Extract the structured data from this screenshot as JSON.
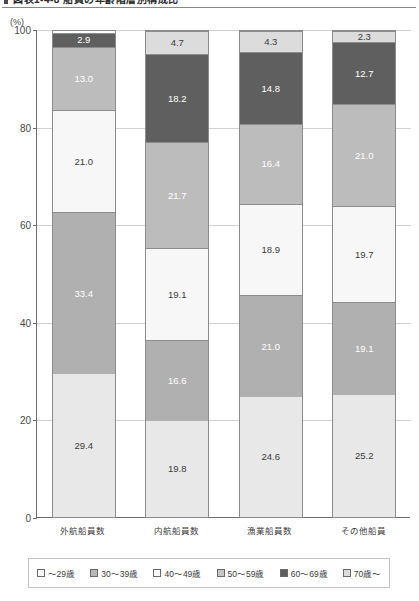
{
  "title": "図表1-4-8 船員の年齢階層別構成比",
  "axis": {
    "unit_label": "(%)",
    "y_ticks": [
      "100",
      "80",
      "60",
      "40",
      "20",
      "0"
    ]
  },
  "chart_data": {
    "type": "bar",
    "title": "図表1-4-8 船員の年齢階層別構成比",
    "subtitle": "",
    "xlabel": "",
    "ylabel": "(%)",
    "ylim": [
      0,
      100
    ],
    "yticks": [
      0,
      20,
      40,
      60,
      80,
      100
    ],
    "grid": true,
    "stacked": true,
    "stack_order": "bottom-to-top",
    "legend_position": "bottom",
    "categories": [
      "外航船員数",
      "内航船員数",
      "漁業船員数",
      "その他船員"
    ],
    "series": [
      {
        "name": "～29歳",
        "color": "#e8e8e8",
        "values": [
          29.4,
          19.8,
          24.6,
          25.2
        ]
      },
      {
        "name": "30～39歳",
        "color": "#b0b0b0",
        "values": [
          33.4,
          16.6,
          21.0,
          19.1
        ]
      },
      {
        "name": "40～49歳",
        "color": "#f7f7f7",
        "values": [
          21.0,
          19.1,
          18.9,
          19.7
        ]
      },
      {
        "name": "50～59歳",
        "color": "#bcbcbc",
        "values": [
          13.0,
          21.7,
          16.4,
          21.0
        ]
      },
      {
        "name": "60～69歳",
        "color": "#5f5f5f",
        "values": [
          2.9,
          18.2,
          14.8,
          12.7
        ]
      },
      {
        "name": "70歳～",
        "color": "#dcdcdc",
        "values": [
          0.0,
          4.7,
          4.3,
          2.3
        ]
      }
    ]
  },
  "bars": [
    {
      "category": "外航船員数",
      "segments": [
        {
          "label": "29.4",
          "value": 29.4,
          "color": "#e8e8e8",
          "text_color": "#3b3b3b"
        },
        {
          "label": "33.4",
          "value": 33.4,
          "color": "#b0b0b0",
          "text_color": "#ffffff"
        },
        {
          "label": "21.0",
          "value": 21.0,
          "color": "#f7f7f7",
          "text_color": "#3b3b3b"
        },
        {
          "label": "13.0",
          "value": 13.0,
          "color": "#bcbcbc",
          "text_color": "#ffffff"
        },
        {
          "label": "2.9",
          "value": 2.9,
          "color": "#5f5f5f",
          "text_color": "#ffffff"
        }
      ]
    },
    {
      "category": "内航船員数",
      "segments": [
        {
          "label": "19.8",
          "value": 19.8,
          "color": "#e8e8e8",
          "text_color": "#3b3b3b"
        },
        {
          "label": "16.6",
          "value": 16.6,
          "color": "#b0b0b0",
          "text_color": "#ffffff"
        },
        {
          "label": "19.1",
          "value": 19.1,
          "color": "#f7f7f7",
          "text_color": "#3b3b3b"
        },
        {
          "label": "21.7",
          "value": 21.7,
          "color": "#bcbcbc",
          "text_color": "#ffffff"
        },
        {
          "label": "18.2",
          "value": 18.2,
          "color": "#5f5f5f",
          "text_color": "#ffffff"
        },
        {
          "label": "4.7",
          "value": 4.7,
          "color": "#dcdcdc",
          "text_color": "#3b3b3b"
        }
      ]
    },
    {
      "category": "漁業船員数",
      "segments": [
        {
          "label": "24.6",
          "value": 24.6,
          "color": "#e8e8e8",
          "text_color": "#3b3b3b"
        },
        {
          "label": "21.0",
          "value": 21.0,
          "color": "#b0b0b0",
          "text_color": "#ffffff"
        },
        {
          "label": "18.9",
          "value": 18.9,
          "color": "#f7f7f7",
          "text_color": "#3b3b3b"
        },
        {
          "label": "16.4",
          "value": 16.4,
          "color": "#bcbcbc",
          "text_color": "#ffffff"
        },
        {
          "label": "14.8",
          "value": 14.8,
          "color": "#5f5f5f",
          "text_color": "#ffffff"
        },
        {
          "label": "4.3",
          "value": 4.3,
          "color": "#dcdcdc",
          "text_color": "#3b3b3b"
        }
      ]
    },
    {
      "category": "その他船員",
      "segments": [
        {
          "label": "25.2",
          "value": 25.2,
          "color": "#e8e8e8",
          "text_color": "#3b3b3b"
        },
        {
          "label": "19.1",
          "value": 19.1,
          "color": "#b0b0b0",
          "text_color": "#ffffff"
        },
        {
          "label": "19.7",
          "value": 19.7,
          "color": "#f7f7f7",
          "text_color": "#3b3b3b"
        },
        {
          "label": "21.0",
          "value": 21.0,
          "color": "#bcbcbc",
          "text_color": "#ffffff"
        },
        {
          "label": "12.7",
          "value": 12.7,
          "color": "#5f5f5f",
          "text_color": "#ffffff"
        },
        {
          "label": "2.3",
          "value": 2.3,
          "color": "#dcdcdc",
          "text_color": "#3b3b3b"
        }
      ]
    }
  ],
  "legend": {
    "items": [
      {
        "label": "～29歳",
        "color": "#f7f7f7"
      },
      {
        "label": "30～39歳",
        "color": "#b8b8b8"
      },
      {
        "label": "40～49歳",
        "color": "#fbfbfb"
      },
      {
        "label": "50～59歳",
        "color": "#c6c6c6"
      },
      {
        "label": "60～69歳",
        "color": "#5f5f5f"
      },
      {
        "label": "70歳～",
        "color": "#dcdcdc"
      }
    ]
  }
}
